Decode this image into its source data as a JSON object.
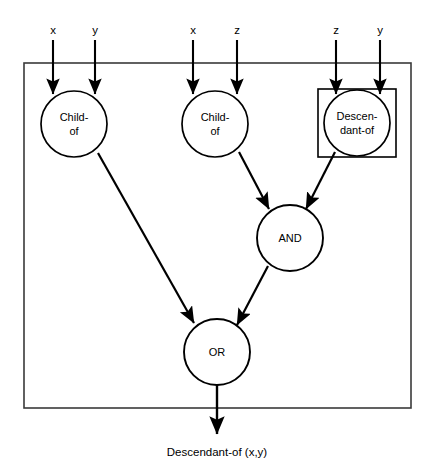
{
  "diagram": {
    "type": "circuit-graph",
    "outer_box": {
      "x": 24,
      "y": 63,
      "width": 387,
      "height": 345,
      "stroke": "#2b2b2b"
    },
    "inner_box": {
      "x": 318,
      "y": 89,
      "width": 78,
      "height": 68,
      "stroke": "#000000"
    },
    "nodes": [
      {
        "id": "childof-1",
        "label_line1": "Child-",
        "label_line2": "of",
        "cx": 74,
        "cy": 124,
        "r": 33
      },
      {
        "id": "childof-2",
        "label_line1": "Child-",
        "label_line2": "of",
        "cx": 215,
        "cy": 124,
        "r": 33
      },
      {
        "id": "descendantof",
        "label_line1": "Descen-",
        "label_line2": "dant-of",
        "cx": 357,
        "cy": 123,
        "r": 33
      },
      {
        "id": "and-gate",
        "label_line1": "AND",
        "label_line2": "",
        "cx": 290,
        "cy": 238,
        "r": 33
      },
      {
        "id": "or-gate",
        "label_line1": "OR",
        "label_line2": "",
        "cx": 217,
        "cy": 352,
        "r": 33
      }
    ],
    "inputs": [
      {
        "id": "input-x-1",
        "label": "x",
        "x": 53,
        "label_y": 34,
        "line_from_y": 40,
        "line_to_y": 96
      },
      {
        "id": "input-y-1",
        "label": "y",
        "x": 95,
        "label_y": 34,
        "line_from_y": 40,
        "line_to_y": 96
      },
      {
        "id": "input-x-2",
        "label": "x",
        "x": 193,
        "label_y": 34,
        "line_from_y": 40,
        "line_to_y": 96
      },
      {
        "id": "input-z-2",
        "label": "z",
        "x": 237,
        "label_y": 34,
        "line_from_y": 40,
        "line_to_y": 96
      },
      {
        "id": "input-z-3",
        "label": "z",
        "x": 336,
        "label_y": 34,
        "line_from_y": 40,
        "line_to_y": 96
      },
      {
        "id": "input-y-3",
        "label": "y",
        "x": 380,
        "label_y": 34,
        "line_from_y": 40,
        "line_to_y": 96
      }
    ],
    "edges": [
      {
        "id": "childof1-to-or",
        "from": "childof-1",
        "to": "or-gate",
        "x1": 98,
        "y1": 153,
        "x2": 196,
        "y2": 326
      },
      {
        "id": "childof2-to-and",
        "from": "childof-2",
        "to": "and-gate",
        "x1": 239,
        "y1": 152,
        "x2": 270,
        "y2": 211
      },
      {
        "id": "descendantof-to-and",
        "from": "descendantof",
        "to": "and-gate",
        "x1": 334,
        "y1": 151,
        "x2": 305,
        "y2": 210
      },
      {
        "id": "and-to-or",
        "from": "and-gate",
        "to": "or-gate",
        "x1": 268,
        "y1": 266,
        "x2": 236,
        "y2": 327
      },
      {
        "id": "or-to-output",
        "from": "or-gate",
        "to": "output",
        "x1": 217,
        "y1": 385,
        "x2": 217,
        "y2": 436
      }
    ],
    "output": {
      "id": "output-label",
      "label": "Descendant-of (x,y)",
      "x": 217,
      "y": 455
    },
    "colors": {
      "stroke": "#000000",
      "box_stroke": "#3a3a3a",
      "background": "#ffffff",
      "node_fill": "#ffffff"
    }
  }
}
